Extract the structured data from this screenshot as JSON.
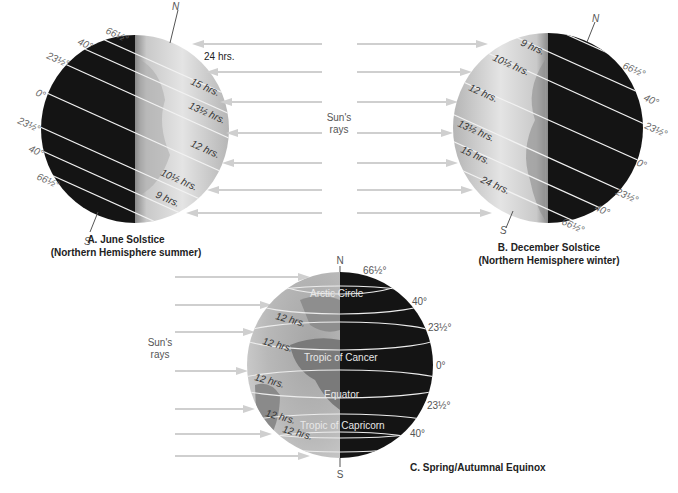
{
  "colors": {
    "ray": "#cfcfcf",
    "night": "#141414",
    "day_light": "#e6e6e6",
    "day_dark": "#9a9a9a",
    "latitude_line": "#f2f2f2"
  },
  "sun_rays_label_top": {
    "line1": "Sun's",
    "line2": "rays"
  },
  "sun_rays_label_bottom": {
    "line1": "Sun's",
    "line2": "rays"
  },
  "panel_a": {
    "caption_line1": "A. June Solstice",
    "caption_line2": "(Northern Hemisphere summer)",
    "north_label": "N",
    "south_label": "S",
    "latitudes": [
      "66½°",
      "40°",
      "23½°",
      "0°",
      "23½°",
      "40°",
      "66½°"
    ],
    "day_lengths": [
      "24 hrs.",
      "15 hrs.",
      "13½ hrs.",
      "12 hrs.",
      "10½ hrs.",
      "9 hrs."
    ]
  },
  "panel_b": {
    "caption_line1": "B. December Solstice",
    "caption_line2": "(Northern Hemisphere winter)",
    "north_label": "N",
    "south_label": "S",
    "latitudes": [
      "66½°",
      "40°",
      "23½°",
      "0°",
      "23½°",
      "40°",
      "66½°"
    ],
    "day_lengths": [
      "9 hrs.",
      "10½ hrs.",
      "12 hrs.",
      "13½ hrs.",
      "15 hrs.",
      "24 hrs."
    ]
  },
  "panel_c": {
    "caption": "C. Spring/Autumnal Equinox",
    "north_label": "N",
    "south_label": "S",
    "latitudes": [
      "66½°",
      "40°",
      "23½°",
      "0°",
      "23½°",
      "40°"
    ],
    "circles": [
      "Arctic Circle",
      "Tropic of Cancer",
      "Equator",
      "Tropic of Capricorn"
    ],
    "day_lengths": [
      "12 hrs.",
      "12 hrs.",
      "12 hrs.",
      "12 hrs.",
      "12 hrs."
    ]
  }
}
